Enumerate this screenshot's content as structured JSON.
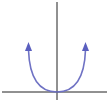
{
  "diagram": {
    "type": "parabola-graph",
    "colors": {
      "axes": "#222222",
      "curve": "#6f72c4",
      "background": "#ffffff"
    },
    "axes": {
      "x_axis": {
        "y": 92,
        "x_start": 2,
        "x_end": 107
      },
      "y_axis": {
        "x": 57,
        "y_start": 2,
        "y_end": 100
      }
    },
    "curve": {
      "vertex": [
        57,
        92
      ],
      "left_end": [
        28,
        44
      ],
      "right_end": [
        83,
        44
      ],
      "arrows": [
        "left",
        "right"
      ]
    }
  }
}
